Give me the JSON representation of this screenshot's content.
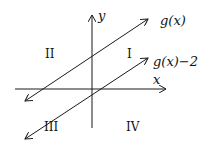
{
  "diagram": {
    "axes": {
      "x_label": "x",
      "y_label": "y"
    },
    "lines": [
      {
        "label": "g(x)"
      },
      {
        "label": "g(x)−2"
      }
    ],
    "quadrants": {
      "q1": "I",
      "q2": "II",
      "q3": "III",
      "q4": "IV"
    },
    "colors": {
      "stroke": "#1a1a1a",
      "background": "#ffffff"
    }
  }
}
